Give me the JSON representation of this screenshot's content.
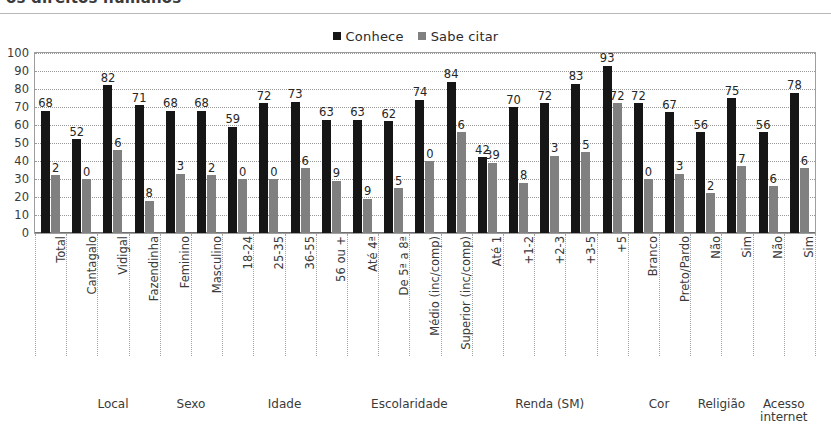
{
  "figure": {
    "cut_title": "os direitos humanos",
    "legend": [
      {
        "label": "Conhece",
        "color": "#161616"
      },
      {
        "label": "Sabe citar",
        "color": "#808080"
      }
    ]
  },
  "chart_data": {
    "type": "bar",
    "title": "os direitos humanos",
    "xlabel": "",
    "ylabel": "",
    "ylim": [
      0,
      100
    ],
    "yticks": [
      "0",
      "10",
      "20",
      "30",
      "40",
      "50",
      "60",
      "70",
      "80",
      "90",
      "100"
    ],
    "grid": true,
    "legend_position": "top-center",
    "categories": [
      "Total",
      "Cantagalo",
      "Vidigal",
      "Fazendinha",
      "Feminino",
      "Masculino",
      "18-24",
      "25-35",
      "36-55",
      "56 ou +",
      "Até 4ª",
      "De 5ª a 8ª",
      "Médio (inc/comp)",
      "Superior (inc/comp)",
      "Até 1",
      "+1-2",
      "+2-3",
      "+3-5",
      "+5",
      "Branco",
      "Preto/Pardo",
      "Não",
      "Sim",
      "Não",
      "Sim"
    ],
    "series": [
      {
        "name": "Conhece",
        "color": "#161616",
        "values": [
          68,
          52,
          82,
          71,
          68,
          68,
          59,
          72,
          73,
          63,
          63,
          62,
          74,
          84,
          42,
          70,
          72,
          83,
          93,
          72,
          67,
          56,
          75,
          56,
          78
        ],
        "labels": [
          "68",
          "52",
          "82",
          "71",
          "68",
          "68",
          "59",
          "72",
          "73",
          "63",
          "63",
          "62",
          "74",
          "84",
          "42",
          "70",
          "72",
          "83",
          "93",
          "72",
          "67",
          "56",
          "75",
          "56",
          "78"
        ]
      },
      {
        "name": "Sabe citar",
        "color": "#808080",
        "values": [
          32,
          30,
          46,
          18,
          33,
          32,
          30,
          30,
          36,
          29,
          19,
          25,
          40,
          56,
          39,
          28,
          43,
          45,
          72,
          30,
          33,
          22,
          37,
          26,
          36
        ],
        "labels": [
          "2",
          "0",
          "6",
          "8",
          "3",
          "2",
          "0",
          "0",
          "6",
          "9",
          "9",
          "5",
          "0",
          "6",
          "39",
          "8",
          "3",
          "5",
          "72",
          "0",
          "3",
          "2",
          "7",
          "6",
          "6"
        ]
      }
    ],
    "groups": [
      {
        "label": "",
        "span": 1
      },
      {
        "label": "Local",
        "span": 3
      },
      {
        "label": "Sexo",
        "span": 2
      },
      {
        "label": "Idade",
        "span": 4
      },
      {
        "label": "Escolaridade",
        "span": 4
      },
      {
        "label": "Renda (SM)",
        "span": 5
      },
      {
        "label": "Cor",
        "span": 2
      },
      {
        "label": "Religião",
        "span": 2
      },
      {
        "label": "Acesso internet",
        "span": 2
      }
    ]
  }
}
